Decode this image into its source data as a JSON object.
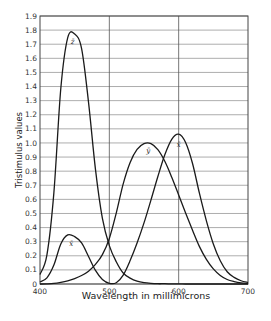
{
  "chart_data": {
    "type": "line",
    "title": "",
    "xlabel": "Wavelength in millimicrons",
    "ylabel": "Tristimulus values",
    "xlim": [
      400,
      700
    ],
    "ylim": [
      0,
      1.9
    ],
    "grid": {
      "horizontal": true,
      "vertical_major": [
        500,
        600
      ]
    },
    "x_ticks": [
      "400",
      "500",
      "600",
      "700"
    ],
    "y_ticks": [
      "0",
      "0.1",
      "0.2",
      "0.3",
      "0.4",
      "0.5",
      "0.6",
      "0.7",
      "0.8",
      "0.9",
      "1.0",
      "1.1",
      "1.2",
      "1.3",
      "1.4",
      "1.5",
      "1.6",
      "1.7",
      "1.8",
      "1.9"
    ],
    "x": [
      400,
      410,
      420,
      430,
      440,
      450,
      460,
      470,
      480,
      490,
      500,
      510,
      520,
      530,
      540,
      550,
      560,
      570,
      580,
      590,
      600,
      610,
      620,
      630,
      640,
      650,
      660,
      670,
      680,
      690,
      700
    ],
    "series": [
      {
        "name": "x̄",
        "label_pos": [
          [
            445,
            0.27
          ],
          [
            600,
            0.97
          ]
        ],
        "values": [
          0.014,
          0.044,
          0.134,
          0.284,
          0.348,
          0.336,
          0.291,
          0.195,
          0.096,
          0.032,
          0.005,
          0.009,
          0.063,
          0.166,
          0.29,
          0.433,
          0.595,
          0.762,
          0.916,
          1.026,
          1.062,
          1.003,
          0.854,
          0.642,
          0.448,
          0.284,
          0.165,
          0.087,
          0.047,
          0.023,
          0.011
        ]
      },
      {
        "name": "ȳ",
        "label_pos": [
          [
            556,
            0.93
          ]
        ],
        "values": [
          0.0,
          0.001,
          0.004,
          0.012,
          0.023,
          0.038,
          0.06,
          0.091,
          0.139,
          0.208,
          0.323,
          0.503,
          0.71,
          0.862,
          0.954,
          0.995,
          0.995,
          0.952,
          0.87,
          0.757,
          0.631,
          0.503,
          0.381,
          0.265,
          0.175,
          0.107,
          0.061,
          0.032,
          0.017,
          0.008,
          0.004
        ]
      },
      {
        "name": "z̄",
        "label_pos": [
          [
            447,
            1.7
          ]
        ],
        "values": [
          0.068,
          0.207,
          0.646,
          1.386,
          1.747,
          1.772,
          1.669,
          1.288,
          0.813,
          0.465,
          0.272,
          0.158,
          0.078,
          0.042,
          0.02,
          0.009,
          0.004,
          0.002,
          0.002,
          0.001,
          0.001,
          0.0,
          0.0,
          0.0,
          0.0,
          0.0,
          0.0,
          0.0,
          0.0,
          0.0,
          0.0
        ]
      }
    ]
  }
}
